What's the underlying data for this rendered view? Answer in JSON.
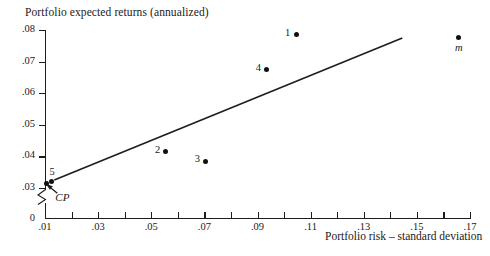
{
  "chart_data": {
    "type": "scatter",
    "title": "Portfolio expected returns (annualized)",
    "xlabel": "Portfolio risk – standard deviation",
    "ylabel": "Portfolio expected returns (annualized)",
    "xlim": [
      0.01,
      0.17
    ],
    "ylim": [
      0.03,
      0.08
    ],
    "y_axis_break": true,
    "y_axis_origin_label": "0",
    "grid": false,
    "legend": "none",
    "x_tick_labels": [
      ".01",
      ".03",
      ".05",
      ".07",
      ".09",
      ".11",
      ".13",
      ".15",
      ".17"
    ],
    "x_tick_values": [
      0.01,
      0.03,
      0.05,
      0.07,
      0.09,
      0.11,
      0.13,
      0.15,
      0.17
    ],
    "x_minor_tick_values": [
      0.02,
      0.04,
      0.06,
      0.08,
      0.1,
      0.12,
      0.14,
      0.16
    ],
    "y_tick_labels": [
      ".08",
      ".07",
      ".06",
      ".05",
      ".04",
      ".03"
    ],
    "y_tick_values": [
      0.08,
      0.07,
      0.06,
      0.05,
      0.04,
      0.03
    ],
    "points": [
      {
        "label": "CP",
        "x": 0.0105,
        "y": 0.0315,
        "label_style": "italic",
        "label_pos": "below-arrow"
      },
      {
        "label": "5",
        "x": 0.0125,
        "y": 0.032,
        "label_style": "plain",
        "label_pos": "above"
      },
      {
        "label": "2",
        "x": 0.0555,
        "y": 0.0415,
        "label_style": "plain",
        "label_pos": "left"
      },
      {
        "label": "3",
        "x": 0.0705,
        "y": 0.0385,
        "label_style": "plain",
        "label_pos": "left"
      },
      {
        "label": "4",
        "x": 0.0935,
        "y": 0.0675,
        "label_style": "plain",
        "label_pos": "left"
      },
      {
        "label": "1",
        "x": 0.1045,
        "y": 0.0785,
        "label_style": "plain",
        "label_pos": "left"
      },
      {
        "label": "m",
        "x": 0.1655,
        "y": 0.0775,
        "label_style": "italic",
        "label_pos": "below"
      }
    ],
    "line": {
      "name": "capital market line",
      "x0": 0.0135,
      "y0": 0.0325,
      "x1": 0.1445,
      "y1": 0.0775
    },
    "annotations": [
      {
        "text": "CP",
        "target_x": 0.0105,
        "target_y": 0.0315,
        "style": "arrow"
      }
    ],
    "colors": {
      "ink": "#1a1a1a",
      "point": "#111111",
      "background": "#ffffff"
    }
  }
}
